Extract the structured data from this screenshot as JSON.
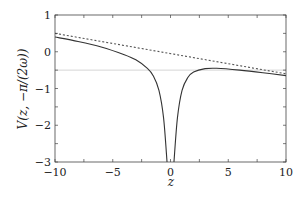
{
  "chart_data": {
    "type": "line",
    "title": "",
    "xlabel": "z",
    "ylabel": "V(z, −π/(2ω))",
    "xlim": [
      -10,
      10
    ],
    "ylim": [
      -3,
      1
    ],
    "x_ticks": [
      "−10",
      "−5",
      "0",
      "5",
      "10"
    ],
    "y_ticks": [
      "1",
      "0",
      "−1",
      "−2",
      "−3"
    ],
    "grid": false,
    "legend": null,
    "series": [
      {
        "name": "solid",
        "style": "solid",
        "color": "#333333",
        "x": [
          -10,
          -8,
          -6,
          -4,
          -3,
          -2,
          -1.5,
          -1,
          -0.6,
          -0.3
        ],
        "y": [
          0.4,
          0.28,
          0.13,
          -0.08,
          -0.22,
          -0.45,
          -0.65,
          -1.05,
          -1.8,
          -3.0
        ]
      },
      {
        "name": "solid-right",
        "style": "solid",
        "color": "#333333",
        "x": [
          0.3,
          0.6,
          1,
          1.5,
          2,
          3,
          4,
          6,
          8,
          10
        ],
        "y": [
          -3.0,
          -1.8,
          -1.05,
          -0.7,
          -0.55,
          -0.46,
          -0.45,
          -0.5,
          -0.57,
          -0.65
        ]
      },
      {
        "name": "dashed",
        "style": "dashed",
        "color": "#555555",
        "x": [
          -10,
          10
        ],
        "y": [
          0.5,
          -0.6
        ]
      },
      {
        "name": "reference",
        "style": "solid",
        "color": "#cccccc",
        "x": [
          -10,
          10
        ],
        "y": [
          -0.5,
          -0.5
        ]
      }
    ]
  }
}
